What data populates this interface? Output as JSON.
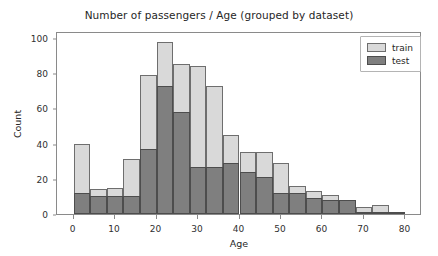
{
  "chart_data": {
    "type": "bar",
    "subtype": "histogram-overlay",
    "title": "Number of passengers / Age (grouped by dataset)",
    "xlabel": "Age",
    "ylabel": "Count",
    "xlim": [
      -4,
      84
    ],
    "ylim": [
      0,
      104
    ],
    "xticks": [
      0,
      10,
      20,
      30,
      40,
      50,
      60,
      70,
      80
    ],
    "yticks": [
      0,
      20,
      40,
      60,
      80,
      100
    ],
    "grid": false,
    "legend_position": "upper right",
    "bin_width": 4,
    "bin_starts": [
      0,
      4,
      8,
      12,
      16,
      20,
      24,
      28,
      32,
      36,
      40,
      44,
      48,
      52,
      56,
      60,
      64,
      68,
      72,
      76
    ],
    "series": [
      {
        "name": "train",
        "color": "#d9d9d9",
        "edge_color": "#6e6e6e",
        "values": [
          40,
          14,
          15,
          31,
          79,
          98,
          85,
          84,
          73,
          45,
          35,
          35,
          29,
          16,
          13,
          11,
          8,
          4,
          5,
          1
        ]
      },
      {
        "name": "test",
        "color": "#7f7f7f",
        "edge_color": "#4d4d4d",
        "values": [
          12,
          10,
          10,
          10,
          37,
          73,
          58,
          27,
          27,
          29,
          24,
          21,
          12,
          12,
          9,
          8,
          8,
          1,
          1,
          1
        ]
      }
    ]
  },
  "legend": {
    "items": [
      {
        "label": "train"
      },
      {
        "label": "test"
      }
    ]
  }
}
